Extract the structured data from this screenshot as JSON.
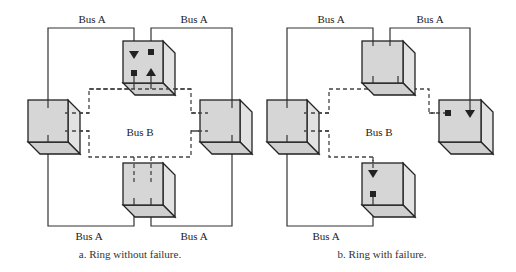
{
  "figure": {
    "panels": [
      {
        "id": "a",
        "caption": "a. Ring without failure.",
        "bus_b_label": "Bus B",
        "bus_a_labels": [
          "Bus A",
          "Bus A",
          "Bus A",
          "Bus A"
        ],
        "nodes": [
          "top",
          "left",
          "right",
          "bottom"
        ],
        "top_node_markers": [
          "arrow-down",
          "square",
          "square",
          "arrow-up"
        ]
      },
      {
        "id": "b",
        "caption": "b. Ring with failure.",
        "bus_b_label": "Bus B",
        "bus_a_labels": [
          "Bus A",
          "Bus A",
          "Bus A"
        ],
        "nodes": [
          "top",
          "left",
          "right",
          "bottom"
        ],
        "right_node_markers": [
          "square",
          "arrow-down"
        ],
        "bottom_node_markers": [
          "arrow-down",
          "square"
        ]
      }
    ]
  },
  "colors": {
    "cube_front": "#d6d6d6",
    "cube_side": "#e2e2e2",
    "line": "#333333",
    "background": "#ffffff"
  }
}
